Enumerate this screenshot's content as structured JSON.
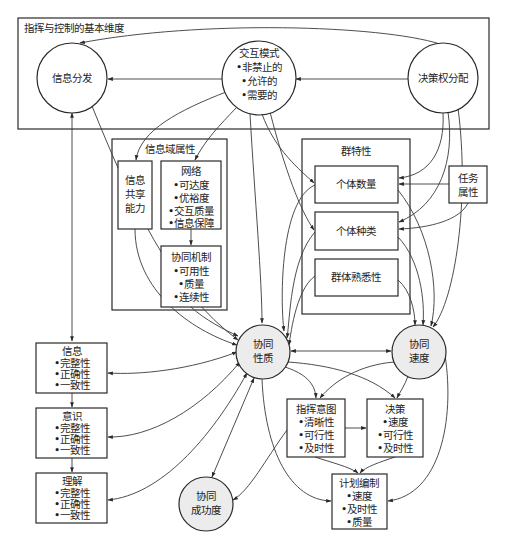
{
  "diagram": {
    "title": "指挥与控制的基本维度",
    "top_frame": {
      "label": "指挥与控制的基本维度",
      "nodes": {
        "info_dissemination": {
          "label": "信息分发"
        },
        "interaction_mode": {
          "label": "交互模式",
          "items": [
            "•非禁止的",
            "•允许的",
            "•需要的"
          ]
        },
        "decision_rights": {
          "label": "决策权分配"
        }
      }
    },
    "info_domain": {
      "label": "信息域属性",
      "sharing": {
        "lines": [
          "信息",
          "共享",
          "能力"
        ]
      },
      "network": {
        "label": "网络",
        "items": [
          "•可达度",
          "•优裕度",
          "•交互质量",
          "•信息保障"
        ]
      },
      "collab_mechanism": {
        "label": "协同机制",
        "items": [
          "•可用性",
          "•质量",
          "•连续性"
        ]
      }
    },
    "group_traits": {
      "label": "群特性",
      "count": {
        "label": "个体数量"
      },
      "variety": {
        "label": "个体种类"
      },
      "familiarity": {
        "label": "群体熟悉性"
      }
    },
    "task_attr": {
      "lines": [
        "任务",
        "属性"
      ]
    },
    "cognition": {
      "information": {
        "label": "信息",
        "items": [
          "•完整性",
          "•正确性",
          "•一致性"
        ]
      },
      "awareness": {
        "label": "意识",
        "items": [
          "•完整性",
          "•正确性",
          "•一致性"
        ]
      },
      "understanding": {
        "label": "理解",
        "items": [
          "•完整性",
          "•正确性",
          "•一致性"
        ]
      }
    },
    "collab_quality": {
      "lines": [
        "协同",
        "性质"
      ]
    },
    "collab_speed": {
      "lines": [
        "协同",
        "速度"
      ]
    },
    "collab_success": {
      "lines": [
        "协同",
        "成功度"
      ]
    },
    "command_intent": {
      "label": "指挥意图",
      "items": [
        "•清晰性",
        "•可行性",
        "•及时性"
      ]
    },
    "decision": {
      "label": "决策",
      "items": [
        "•速度",
        "•可行性",
        "•及时性"
      ]
    },
    "planning": {
      "label": "计划编制",
      "items": [
        "•速度",
        "•及时性",
        "•质量"
      ]
    }
  }
}
